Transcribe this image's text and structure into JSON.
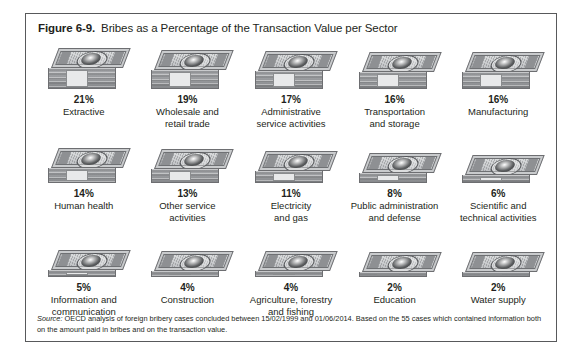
{
  "figure": {
    "label": "Figure 6-9.",
    "title": "Bribes as a Percentage of the Transaction Value per Sector",
    "source_label": "Source:",
    "source_text": " OECD analysis of foreign bribery cases concluded between 15/02/1999 and 01/06/2014. Based on the 55 cases which contained information both on the amount paid in bribes and on the transaction value."
  },
  "chart_data": {
    "type": "bar",
    "title": "Bribes as a Percentage of the Transaction Value per Sector",
    "xlabel": "Sector",
    "ylabel": "Bribes as a percentage of the transaction value",
    "unit": "%",
    "ylim": [
      0,
      21
    ],
    "grid": false,
    "legend": "none",
    "pictogram": "money-stack",
    "categories": [
      "Extractive",
      "Wholesale and retail trade",
      "Administrative service activities",
      "Transportation and storage",
      "Manufacturing",
      "Human health",
      "Other service activities",
      "Electricity and gas",
      "Public administration and defense",
      "Scientific and technical activities",
      "Information and communication",
      "Construction",
      "Agriculture, forestry and fishing",
      "Education",
      "Water supply"
    ],
    "values": [
      21,
      19,
      17,
      16,
      16,
      14,
      13,
      11,
      8,
      6,
      5,
      4,
      4,
      2,
      2
    ]
  },
  "cells": [
    {
      "pct": "21%",
      "sector": "Extractive",
      "value": 21
    },
    {
      "pct": "19%",
      "sector": "Wholesale and\nretail trade",
      "value": 19
    },
    {
      "pct": "17%",
      "sector": "Administrative\nservice activities",
      "value": 17
    },
    {
      "pct": "16%",
      "sector": "Transportation\nand storage",
      "value": 16
    },
    {
      "pct": "16%",
      "sector": "Manufacturing",
      "value": 16
    },
    {
      "pct": "14%",
      "sector": "Human health",
      "value": 14
    },
    {
      "pct": "13%",
      "sector": "Other service\nactivities",
      "value": 13
    },
    {
      "pct": "11%",
      "sector": "Electricity\nand gas",
      "value": 11
    },
    {
      "pct": "8%",
      "sector": "Public administration\nand defense",
      "value": 8
    },
    {
      "pct": "6%",
      "sector": "Scientific and\ntechnical activities",
      "value": 6
    },
    {
      "pct": "5%",
      "sector": "Information and\ncommunication",
      "value": 5
    },
    {
      "pct": "4%",
      "sector": "Construction",
      "value": 4
    },
    {
      "pct": "4%",
      "sector": "Agriculture, forestry\nand fishing",
      "value": 4
    },
    {
      "pct": "2%",
      "sector": "Education",
      "value": 2
    },
    {
      "pct": "2%",
      "sector": "Water supply",
      "value": 2
    }
  ],
  "colors": {
    "border": "#58595b",
    "text": "#231f20",
    "background": "#ffffff",
    "money_light": "#c9cbcd",
    "money_mid": "#a7a9ac",
    "money_dark": "#6d6e71"
  }
}
